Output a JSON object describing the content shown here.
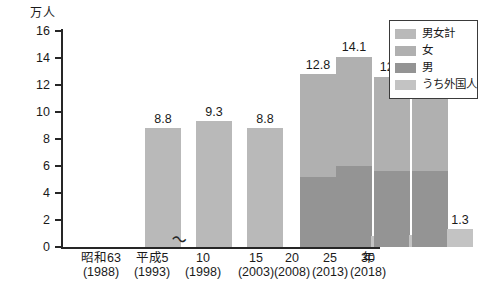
{
  "chart_data": {
    "type": "bar",
    "title": "",
    "subtitle": "",
    "xlabel": "年",
    "ylabel": "万人",
    "ylim": [
      0,
      16
    ],
    "yticks": [
      0,
      2,
      4,
      6,
      8,
      10,
      12,
      14,
      16
    ],
    "grid": false,
    "legend_position": "top-right",
    "axis_break": true,
    "axis_break_symbol": "〜",
    "axis_break_note": "break in x-axis between 10 (1998) and 15 (2003)",
    "categories": [
      "昭和63\n(1988)",
      "平成5\n(1993)",
      "10\n(1998)",
      "15\n(2003)",
      "20\n(2008)",
      "25\n(2013)",
      "30\n(2018)"
    ],
    "category_eras": [
      "昭和63",
      "平成5",
      "10",
      "15",
      "20",
      "25",
      "30"
    ],
    "category_years": [
      "(1988)",
      "(1993)",
      "(1998)",
      "(2003)",
      "(2008)",
      "(2013)",
      "(2018)"
    ],
    "series": [
      {
        "name": "男女計",
        "color": "#b9b9b9",
        "values": [
          8.8,
          9.3,
          8.8,
          null,
          null,
          null,
          null
        ],
        "labels": [
          "8.8",
          "9.3",
          "8.8",
          "",
          "",
          "",
          ""
        ]
      },
      {
        "name": "男",
        "color": "#949494",
        "values": [
          null,
          null,
          null,
          5.2,
          6.0,
          5.65,
          5.6
        ],
        "labels": [
          "",
          "",
          "",
          "",
          "",
          "",
          ""
        ]
      },
      {
        "name": "女",
        "color": "#b0b0b0",
        "values": [
          null,
          null,
          null,
          7.6,
          8.1,
          6.95,
          6.4
        ],
        "labels": [
          "",
          "",
          "",
          "",
          "",
          "",
          ""
        ]
      },
      {
        "name": "合計(男+女)",
        "color": "#b0b0b0",
        "values": [
          null,
          null,
          null,
          12.8,
          14.1,
          12.6,
          12.0
        ],
        "labels": [
          "",
          "",
          "",
          "12.8",
          "14.1",
          "12.6",
          "12.0"
        ]
      },
      {
        "name": "うち外国人",
        "color": "#c3c3c3",
        "values": [
          null,
          null,
          null,
          null,
          0.8,
          0.9,
          1.3
        ],
        "labels": [
          "",
          "",
          "",
          "",
          "0.8",
          "0.9",
          "1.3"
        ]
      }
    ]
  },
  "axis": {
    "y_unit": "万人",
    "x_unit": "年",
    "break_symbol": "〜",
    "ytick_labels": [
      "0",
      "2",
      "4",
      "6",
      "8",
      "10",
      "12",
      "14",
      "16"
    ]
  },
  "legend": {
    "items": [
      {
        "label": "男女計",
        "color": "#b9b9b9"
      },
      {
        "label": "女",
        "color": "#b0b0b0"
      },
      {
        "label": "男",
        "color": "#949494"
      },
      {
        "label": "うち外国人",
        "color": "#c3c3c3"
      }
    ]
  },
  "bars": [
    {
      "era": "昭和63",
      "year": "(1988)",
      "total_label": "8.8",
      "foreign_label": ""
    },
    {
      "era": "平成5",
      "year": "(1993)",
      "total_label": "9.3",
      "foreign_label": ""
    },
    {
      "era": "10",
      "year": "(1998)",
      "total_label": "8.8",
      "foreign_label": ""
    },
    {
      "era": "15",
      "year": "(2003)",
      "total_label": "12.8",
      "foreign_label": ""
    },
    {
      "era": "20",
      "year": "(2008)",
      "total_label": "14.1",
      "foreign_label": "0.8"
    },
    {
      "era": "25",
      "year": "(2013)",
      "total_label": "12.6",
      "foreign_label": "0.9"
    },
    {
      "era": "30",
      "year": "(2018)",
      "total_label": "12.0",
      "foreign_label": "1.3"
    }
  ]
}
